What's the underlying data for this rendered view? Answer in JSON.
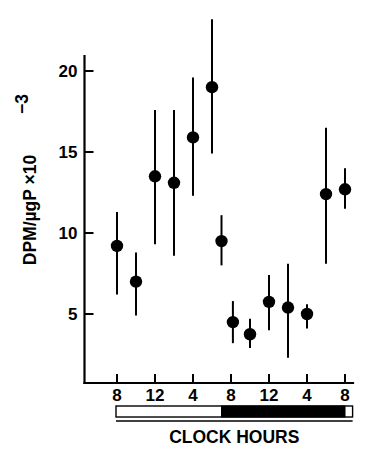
{
  "figure": {
    "background_color": "#ffffff",
    "ink_color": "#000000"
  },
  "chart_data": {
    "type": "scatter",
    "title": "",
    "subtitle": "",
    "xlabel": "CLOCK HOURS",
    "ylabel": "DPM/µgP ×10⁻³",
    "ylabel_parts": {
      "main": "DPM/µgP ×10",
      "exponent": "−3"
    },
    "xlim": [
      6,
      32
    ],
    "ylim": [
      0,
      21.5
    ],
    "grid": false,
    "legend": null,
    "error_bars": "vertical",
    "x_axis": {
      "tick_values": [
        8,
        12,
        16,
        20,
        24,
        28,
        32
      ],
      "tick_labels": [
        "8",
        "12",
        "4",
        "8",
        "12",
        "4",
        "8"
      ],
      "label": "CLOCK HOURS"
    },
    "y_axis": {
      "tick_values": [
        5,
        10,
        15,
        20
      ],
      "tick_labels": [
        "5",
        "10",
        "15",
        "20"
      ],
      "label": "DPM/µgP ×10⁻³"
    },
    "points": [
      {
        "x": 8.0,
        "y": 9.2,
        "ylow": 6.2,
        "yhigh": 11.3
      },
      {
        "x": 10.0,
        "y": 7.0,
        "ylow": 4.9,
        "yhigh": 8.8
      },
      {
        "x": 12.0,
        "y": 13.5,
        "ylow": 9.3,
        "yhigh": 17.6
      },
      {
        "x": 14.0,
        "y": 13.1,
        "ylow": 8.6,
        "yhigh": 17.6
      },
      {
        "x": 16.0,
        "y": 15.9,
        "ylow": 12.3,
        "yhigh": 19.6
      },
      {
        "x": 18.0,
        "y": 19.0,
        "ylow": 14.9,
        "yhigh": 23.2
      },
      {
        "x": 19.0,
        "y": 9.5,
        "ylow": 8.0,
        "yhigh": 11.1
      },
      {
        "x": 20.2,
        "y": 4.5,
        "ylow": 3.2,
        "yhigh": 5.8
      },
      {
        "x": 22.0,
        "y": 3.75,
        "ylow": 2.9,
        "yhigh": 4.7
      },
      {
        "x": 24.0,
        "y": 5.75,
        "ylow": 4.0,
        "yhigh": 7.4
      },
      {
        "x": 26.0,
        "y": 5.4,
        "ylow": 2.3,
        "yhigh": 8.1
      },
      {
        "x": 28.0,
        "y": 5.0,
        "ylow": 4.1,
        "yhigh": 5.6
      },
      {
        "x": 30.0,
        "y": 12.4,
        "ylow": 8.1,
        "yhigh": 16.5
      },
      {
        "x": 32.0,
        "y": 12.7,
        "ylow": 11.5,
        "yhigh": 14.0
      }
    ],
    "photoperiod_bar": {
      "description": "light-dark bar under x-axis",
      "segments": [
        {
          "phase": "light",
          "x_start": 8.0,
          "x_end": 19.0,
          "color": "#ffffff"
        },
        {
          "phase": "dark",
          "x_start": 19.0,
          "x_end": 32.0,
          "color": "#000000"
        },
        {
          "phase": "light",
          "x_start": 32.0,
          "x_end": 32.8,
          "color": "#ffffff"
        }
      ]
    }
  }
}
